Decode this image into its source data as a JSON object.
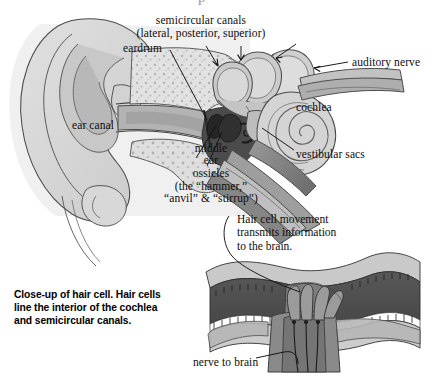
{
  "figure": {
    "title_cut": "p",
    "alt": "Cross-section diagram of the human ear with a close-up of a hair cell"
  },
  "labels": {
    "semicircular_canals": "semicircular canals",
    "semicircular_canals_sub": "(lateral, posterior, superior)",
    "eardrum": "eardrum",
    "auditory_nerve": "auditory nerve",
    "cochlea": "cochlea",
    "vestibular_sacs": "vestibular sacs",
    "ear_canal": "ear canal",
    "middle_ear_line1": "middle",
    "middle_ear_line2": "ear",
    "ossicles": "ossicles",
    "ossicles_sub_line1": "(the “hammer,”",
    "ossicles_sub_line2": "“anvil” & “stirrup”)",
    "nerve_to_brain": "nerve to brain"
  },
  "notes": {
    "hair_cell_movement": "Hair cell movement\ntransmits information\nto the brain."
  },
  "caption": {
    "closeup": "Close-up of hair cell. Hair cells\nline the interior of the cochlea\nand semicircular canals."
  },
  "colors": {
    "background": "#ffffff",
    "outline": "#3a3a3a",
    "text": "#0d0d0d",
    "pinna_light": "#dcdcdc",
    "pinna_mid": "#c6c6c6",
    "pinna_dark": "#b0b0b0",
    "canal_shadow": "#a8a8a8",
    "bone_speckle": "#cfcfcf",
    "middle_ear_dark": "#4a4a4a",
    "ossicle_dark": "#2e2e2e",
    "cochlea_light": "#d2d2d2",
    "cochlea_mid": "#bcbcbc",
    "nerve_mid": "#8e8e8e",
    "nerve_dark": "#6f6f6f",
    "hair_membrane_light": "#c8c8c8",
    "hair_tissue_dark": "#4f4f4f",
    "hair_cell_body": "#7b7b7b",
    "hair_white": "#ffffff"
  }
}
